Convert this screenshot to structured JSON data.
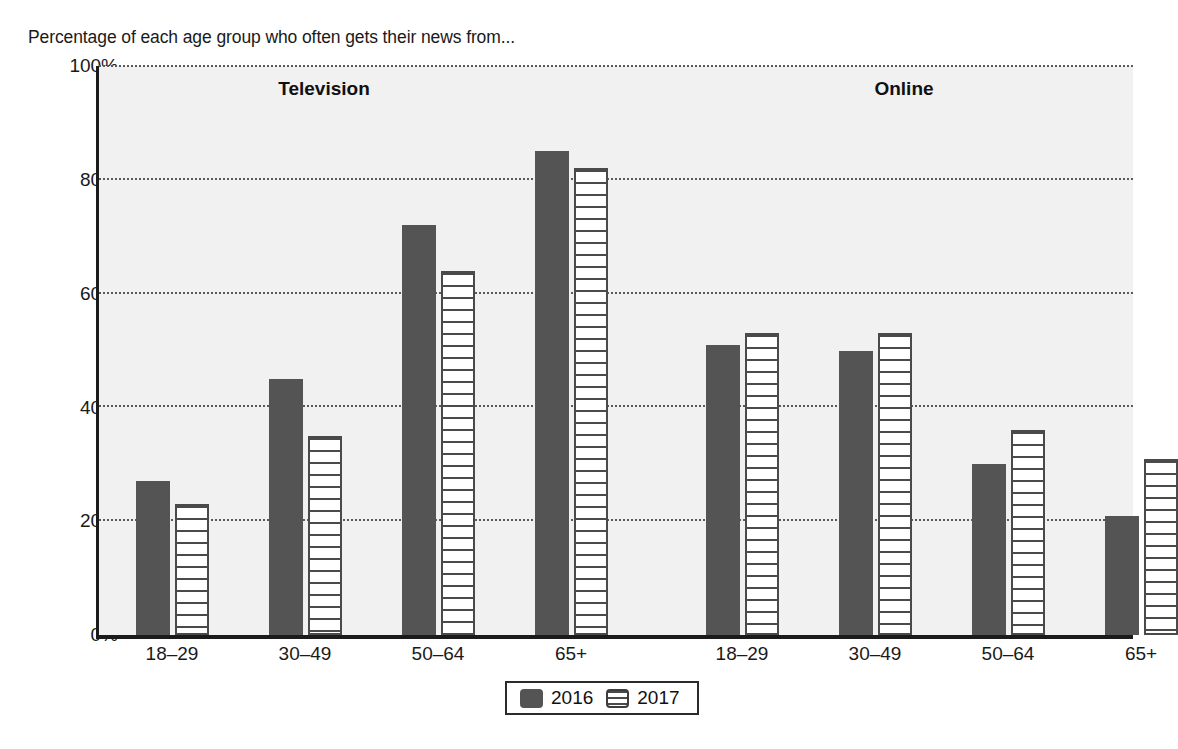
{
  "chart_data": {
    "type": "bar",
    "title": "Percentage of each age group who often gets their news from...",
    "xlabel": "",
    "ylabel": "",
    "ylim": [
      0,
      100
    ],
    "ytick_labels": [
      "0%",
      "20%",
      "40%",
      "60%",
      "80%",
      "100%"
    ],
    "ytick_values": [
      0,
      20,
      40,
      60,
      80,
      100
    ],
    "grid": true,
    "legend_position": "bottom-center",
    "categories": [
      "18–29",
      "30–49",
      "50–64",
      "65+"
    ],
    "panels": [
      {
        "label": "Television",
        "series": [
          {
            "name": "2016",
            "values": [
              27,
              45,
              72,
              85
            ]
          },
          {
            "name": "2017",
            "values": [
              23,
              35,
              64,
              82
            ]
          }
        ]
      },
      {
        "label": "Online",
        "series": [
          {
            "name": "2016",
            "values": [
              51,
              50,
              30,
              21
            ]
          },
          {
            "name": "2017",
            "values": [
              53,
              53,
              36,
              31
            ]
          }
        ]
      }
    ],
    "legend": [
      {
        "name": "2016",
        "swatch": "solid-dark-gray",
        "color": "#545454"
      },
      {
        "name": "2017",
        "swatch": "horizontal-stripes",
        "color": "#ffffff"
      }
    ],
    "colors": {
      "series_2016": "#545454",
      "series_2017": "#ffffff",
      "plot_background": "#f1f1f1",
      "axis": "#1b1b1b",
      "gridline": "#5a5a5a",
      "text": "#1a1a1a"
    }
  }
}
